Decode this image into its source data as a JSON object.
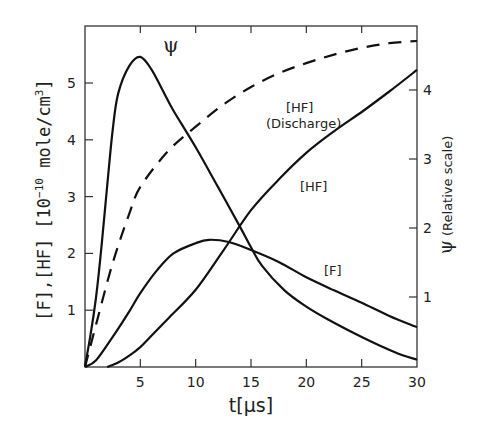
{
  "chart_data": {
    "type": "line",
    "title": "",
    "xlabel": "t[μs]",
    "ylabel": "[F],[HF]  [10⁻¹⁰ mole/cm³]",
    "y2label": "ψ (Relative scale)",
    "xlim": [
      0,
      30
    ],
    "ylim": [
      0,
      5.85
    ],
    "y2lim": [
      0,
      5.3
    ],
    "x_ticks": [
      5,
      10,
      15,
      20,
      25,
      30
    ],
    "y_ticks": [
      1,
      2,
      3,
      4,
      5
    ],
    "y2_ticks": [
      1,
      2,
      3,
      4
    ],
    "grid": false,
    "legend": "inline labels",
    "series": [
      {
        "name": "ψ",
        "axis": "right",
        "style": "solid",
        "label_pos": [
          7.5,
          4.3
        ],
        "points": [
          [
            0,
            0
          ],
          [
            0.5,
            0.45
          ],
          [
            1,
            1.0
          ],
          [
            1.5,
            1.75
          ],
          [
            2,
            2.6
          ],
          [
            2.5,
            3.42
          ],
          [
            3,
            3.95
          ],
          [
            4,
            4.35
          ],
          [
            5,
            4.48
          ],
          [
            6,
            4.3
          ],
          [
            7,
            4.0
          ],
          [
            8,
            3.7
          ],
          [
            10,
            3.17
          ],
          [
            12,
            2.6
          ],
          [
            14,
            2.02
          ],
          [
            15,
            1.72
          ],
          [
            16,
            1.45
          ],
          [
            18,
            1.1
          ],
          [
            20,
            0.86
          ],
          [
            22,
            0.67
          ],
          [
            25,
            0.42
          ],
          [
            28,
            0.2
          ],
          [
            30,
            0.09
          ]
        ]
      },
      {
        "name": "[HF] (Discharge)",
        "axis": "left",
        "style": "dashed",
        "label_pos": [
          18.5,
          4.35
        ],
        "points": [
          [
            0,
            0
          ],
          [
            1,
            0.75
          ],
          [
            2.5,
            1.83
          ],
          [
            4,
            2.7
          ],
          [
            5,
            3.17
          ],
          [
            7.5,
            3.8
          ],
          [
            10,
            4.23
          ],
          [
            12.5,
            4.62
          ],
          [
            15,
            4.93
          ],
          [
            17.5,
            5.17
          ],
          [
            20,
            5.35
          ],
          [
            22.5,
            5.5
          ],
          [
            25,
            5.62
          ],
          [
            27.5,
            5.7
          ],
          [
            30,
            5.74
          ]
        ]
      },
      {
        "name": "[HF]",
        "axis": "left",
        "style": "solid",
        "label_pos": [
          20.5,
          3.2
        ],
        "points": [
          [
            2,
            0
          ],
          [
            3,
            0.08
          ],
          [
            4,
            0.2
          ],
          [
            5,
            0.35
          ],
          [
            6,
            0.55
          ],
          [
            7.5,
            0.85
          ],
          [
            10,
            1.36
          ],
          [
            12.5,
            2.05
          ],
          [
            15,
            2.76
          ],
          [
            17.5,
            3.3
          ],
          [
            20,
            3.77
          ],
          [
            22.5,
            4.15
          ],
          [
            25,
            4.49
          ],
          [
            27.5,
            4.85
          ],
          [
            30,
            5.23
          ]
        ]
      },
      {
        "name": "[F]",
        "axis": "left",
        "style": "solid",
        "label_pos": [
          24.5,
          1.32
        ],
        "points": [
          [
            0,
            0
          ],
          [
            1,
            0.12
          ],
          [
            2.5,
            0.53
          ],
          [
            4,
            0.98
          ],
          [
            5,
            1.3
          ],
          [
            6.5,
            1.7
          ],
          [
            8,
            2.0
          ],
          [
            10,
            2.18
          ],
          [
            11.2,
            2.24
          ],
          [
            13,
            2.2
          ],
          [
            15,
            2.06
          ],
          [
            17.5,
            1.85
          ],
          [
            20,
            1.58
          ],
          [
            22.5,
            1.35
          ],
          [
            25,
            1.13
          ],
          [
            27.5,
            0.9
          ],
          [
            30,
            0.7
          ]
        ]
      }
    ]
  },
  "labels": {
    "x_axis_title": "t[μs]",
    "y_axis_title_main": "[F],[HF]  [10",
    "y_axis_title_exp": "−10",
    "y_axis_title_unit": " mole/cm",
    "y_axis_title_unit_exp": "3",
    "y_axis_title_close": "]",
    "y2_axis_title_symbol": "ψ",
    "y2_axis_title_text": " (Relative scale)",
    "psi": "ψ",
    "hf_discharge_line1": "[HF]",
    "hf_discharge_line2": "(Discharge)",
    "hf": "[HF]",
    "f": "[F]"
  },
  "colors": {
    "line": "#111111",
    "axis": "#333333",
    "background": "#ffffff"
  }
}
